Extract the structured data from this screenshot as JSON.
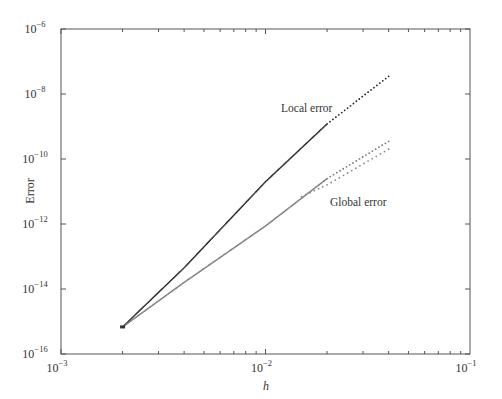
{
  "chart_data": {
    "type": "line",
    "title": "",
    "xlabel": "h",
    "ylabel": "Error",
    "xscale": "log",
    "yscale": "log",
    "xlim": [
      0.001,
      0.1
    ],
    "ylim": [
      1e-16,
      1e-06
    ],
    "grid": false,
    "legend": "none (inline annotations)",
    "x_ticks": [
      {
        "base": "10",
        "exp": "−3",
        "value": 0.001
      },
      {
        "base": "10",
        "exp": "−2",
        "value": 0.01
      },
      {
        "base": "10",
        "exp": "−1",
        "value": 0.1
      }
    ],
    "y_ticks": [
      {
        "base": "10",
        "exp": "−6",
        "value": 1e-06
      },
      {
        "base": "10",
        "exp": "−8",
        "value": 1e-08
      },
      {
        "base": "10",
        "exp": "−10",
        "value": 1e-10
      },
      {
        "base": "10",
        "exp": "−12",
        "value": 1e-12
      },
      {
        "base": "10",
        "exp": "−14",
        "value": 1e-14
      },
      {
        "base": "10",
        "exp": "−16",
        "value": 1e-16
      }
    ],
    "series": [
      {
        "name": "Local error",
        "style": "dense dark dots",
        "color": "#222222",
        "x": [
          0.002,
          0.004,
          0.01,
          0.02,
          0.04
        ],
        "y": [
          6.8e-16,
          4.5e-14,
          2e-11,
          1.2e-09,
          3.5e-08
        ]
      },
      {
        "name": "Global error",
        "style": "dense grey dots, splitting into two dotted branches at large h",
        "color": "#777777",
        "x": [
          0.002,
          0.004,
          0.01,
          0.02,
          0.04
        ],
        "y": [
          6.8e-16,
          1.6e-14,
          8.7e-13,
          2.5e-11,
          3.5e-10
        ]
      },
      {
        "name": "Global error (lower branch)",
        "style": "sparse grey dots",
        "color": "#888888",
        "x": [
          0.015,
          0.02,
          0.04
        ],
        "y": [
          7e-12,
          1.6e-11,
          2e-10
        ]
      }
    ],
    "annotations": [
      {
        "text": "Local error",
        "near_x": 0.006,
        "near_y": 3e-09
      },
      {
        "text": "Global error",
        "near_x": 0.015,
        "near_y": 1.5e-12
      }
    ]
  }
}
